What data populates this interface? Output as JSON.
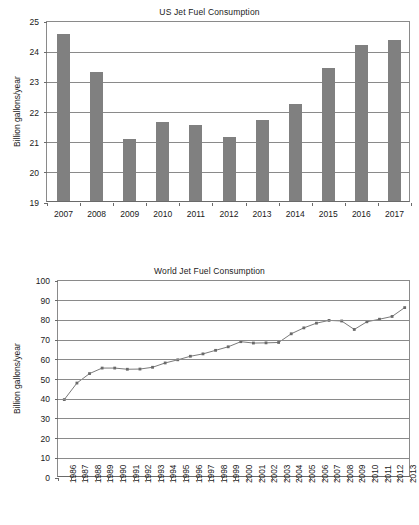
{
  "chart_data": [
    {
      "type": "bar",
      "title": "US Jet Fuel Consumption",
      "xlabel": "",
      "ylabel": "Billion gallons/year",
      "categories": [
        "2007",
        "2008",
        "2009",
        "2010",
        "2011",
        "2012",
        "2013",
        "2014",
        "2015",
        "2016",
        "2017"
      ],
      "values": [
        24.52,
        23.27,
        21.05,
        21.63,
        21.53,
        21.12,
        21.67,
        22.21,
        23.4,
        24.18,
        24.34
      ],
      "ylim": [
        19,
        25
      ],
      "yticks": [
        19,
        20,
        21,
        22,
        23,
        24,
        25
      ],
      "grid": true,
      "legend": "none",
      "bar_color": "#808080"
    },
    {
      "type": "line",
      "title": "World Jet Fuel Consumption",
      "xlabel": "",
      "ylabel": "Billion gallons/year",
      "x": [
        "1986",
        "1987",
        "1988",
        "1989",
        "1990",
        "1991",
        "1992",
        "1993",
        "1994",
        "1995",
        "1996",
        "1997",
        "1998",
        "1999",
        "2000",
        "2001",
        "2002",
        "2003",
        "2004",
        "2005",
        "2006",
        "2007",
        "2008",
        "2009",
        "2010",
        "2011",
        "2012",
        "2013"
      ],
      "values": [
        39.8,
        48.2,
        53.0,
        55.8,
        55.8,
        55.2,
        55.3,
        56.2,
        58.4,
        60.0,
        61.8,
        63.0,
        64.8,
        66.6,
        69.2,
        68.5,
        68.6,
        68.8,
        73.2,
        76.2,
        78.6,
        80.0,
        79.7,
        75.4,
        79.3,
        80.6,
        82.0,
        86.5
      ],
      "ylim": [
        0,
        100
      ],
      "yticks": [
        0,
        10,
        20,
        30,
        40,
        50,
        60,
        70,
        80,
        90,
        100
      ],
      "grid": true,
      "legend": "none",
      "line_color": "#7a7a7a",
      "marker_color": "#6a6a6a"
    }
  ]
}
